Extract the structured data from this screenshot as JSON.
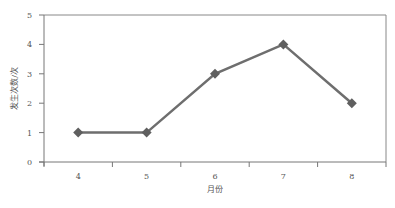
{
  "chart_data": {
    "type": "line",
    "title": "",
    "xlabel": "月份",
    "ylabel": "发生次数/次",
    "categories": [
      "4",
      "5",
      "6",
      "7",
      "8"
    ],
    "series": [
      {
        "name": "发生次数",
        "values": [
          1,
          1,
          3,
          4,
          2
        ],
        "color": "#6e6e6e",
        "marker": "diamond"
      }
    ],
    "yticks": [
      "0",
      "1",
      "2",
      "3",
      "4",
      "5"
    ],
    "ylim": [
      0,
      5
    ],
    "grid": false,
    "legend": "none"
  }
}
